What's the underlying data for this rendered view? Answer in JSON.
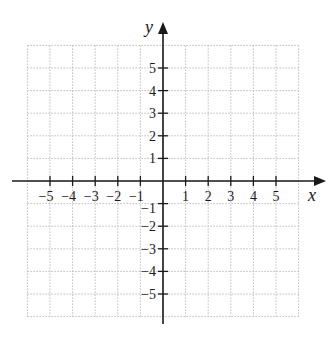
{
  "chart_data": {
    "type": "coordinate-plane",
    "title": "",
    "xlabel": "x",
    "ylabel": "y",
    "xlim": [
      -6,
      6
    ],
    "ylim": [
      -6,
      6
    ],
    "grid": true,
    "grid_style": "dotted",
    "x_ticks": [
      -5,
      -4,
      -3,
      -2,
      -1,
      1,
      2,
      3,
      4,
      5
    ],
    "y_ticks": [
      5,
      4,
      3,
      2,
      1,
      -1,
      -2,
      -3,
      -4,
      -5
    ],
    "x_tick_labels": [
      "−5",
      "−4",
      "−3",
      "−2",
      "−1",
      "1",
      "2",
      "3",
      "4",
      "5"
    ],
    "y_tick_labels": [
      "5",
      "4",
      "3",
      "2",
      "1",
      "−1",
      "−2",
      "−3",
      "−4",
      "−5"
    ],
    "series": []
  },
  "colors": {
    "axis": "#1a1a1a",
    "grid": "#bdbdbd"
  }
}
